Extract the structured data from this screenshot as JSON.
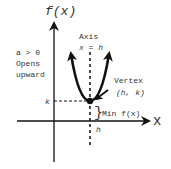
{
  "diagram": {
    "type": "parabola-vertex-form",
    "y_axis_label": "f(x)",
    "x_axis_label": "x",
    "axis_of_symmetry": {
      "title": "Axis",
      "equation": "x = h"
    },
    "condition": {
      "line1": "a > 0",
      "line2": "Opens",
      "line3": "upward"
    },
    "vertex": {
      "title": "Vertex",
      "coords": "(h, k)"
    },
    "k_label": "k",
    "h_label": "h",
    "min_label": "Min f(x)",
    "brace": "}",
    "colors": {
      "stroke": "#111111",
      "text": "#333333",
      "background": "#ffffff"
    }
  }
}
